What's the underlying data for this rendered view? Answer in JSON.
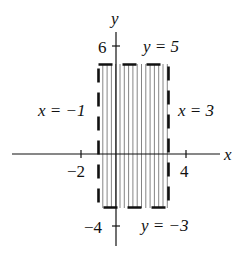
{
  "diagram": {
    "title": "",
    "axes": {
      "x_label": "x",
      "y_label": "y",
      "x_ticks": [
        {
          "value": -2,
          "label": "-2"
        },
        {
          "value": 4,
          "label": "4"
        }
      ],
      "y_ticks": [
        {
          "value": 6,
          "label": "6"
        },
        {
          "value": -4,
          "label": "-4"
        }
      ]
    },
    "region": {
      "shape": "rectangle",
      "fill": "vertical-hatching",
      "boundary_style": "dashed",
      "x_min": -1,
      "x_max": 3,
      "y_min": -3,
      "y_max": 5
    },
    "labels": {
      "left": "x = −1",
      "right": "x = 3",
      "top": "y = 5",
      "bottom": "y = −3",
      "tick_neg2": "−2",
      "tick_4": "4",
      "tick_6": "6",
      "tick_neg4": "−4"
    },
    "colors": {
      "ink": "#111111",
      "hatch": "#777777",
      "background": "#ffffff"
    }
  }
}
